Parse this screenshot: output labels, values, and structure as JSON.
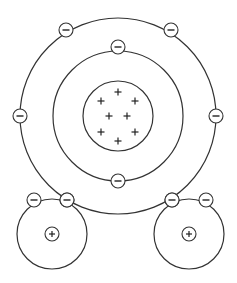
{
  "diagram": {
    "type": "water-molecule-bohr-model",
    "colors": {
      "stroke": "#333333",
      "fill": "#ffffff",
      "sign": "#222222"
    },
    "oxygen": {
      "center": [
        118,
        116
      ],
      "nucleus_radius": 35,
      "protons": [
        [
          118,
          92
        ],
        [
          101,
          101
        ],
        [
          135,
          101
        ],
        [
          109,
          116
        ],
        [
          127,
          116
        ],
        [
          101,
          132
        ],
        [
          135,
          132
        ],
        [
          118,
          141
        ]
      ],
      "inner_shell": {
        "radius": 65,
        "electrons": [
          [
            118,
            47
          ],
          [
            118,
            181
          ]
        ]
      },
      "outer_shell": {
        "radius": 98,
        "electrons": [
          [
            66,
            30
          ],
          [
            171,
            30
          ],
          [
            20,
            116
          ],
          [
            216,
            116
          ],
          [
            67,
            200
          ],
          [
            172,
            200
          ]
        ]
      }
    },
    "hydrogens": [
      {
        "center": [
          52,
          234
        ],
        "radius": 35,
        "proton": [
          52,
          234
        ],
        "electrons": [
          [
            34,
            200
          ],
          [
            67,
            200
          ]
        ]
      },
      {
        "center": [
          189,
          234
        ],
        "radius": 35,
        "proton": [
          189,
          234
        ],
        "electrons": [
          [
            172,
            200
          ],
          [
            206,
            200
          ]
        ]
      }
    ],
    "electron_radius": 7,
    "proton_symbol": "+",
    "electron_symbol": "−"
  }
}
